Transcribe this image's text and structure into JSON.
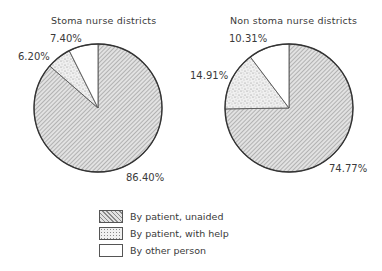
{
  "chart_data": [
    {
      "type": "pie",
      "title": "Stoma nurse districts",
      "categories": [
        "By patient, unaided",
        "By patient, with help",
        "By other person"
      ],
      "values": [
        86.4,
        6.2,
        7.4
      ],
      "labels": [
        "86.40%",
        "6.20%",
        "7.40%"
      ]
    },
    {
      "type": "pie",
      "title": "Non stoma nurse districts",
      "categories": [
        "By patient, unaided",
        "By patient, with help",
        "By other person"
      ],
      "values": [
        74.77,
        14.91,
        10.31
      ],
      "labels": [
        "74.77%",
        "14.91%",
        "10.31%"
      ]
    }
  ],
  "legend": {
    "position": "bottom-center",
    "items": [
      {
        "label": "By patient, unaided",
        "pattern": "diagonal-hatch"
      },
      {
        "label": "By patient, with help",
        "pattern": "stipple"
      },
      {
        "label": "By other person",
        "pattern": "white"
      }
    ]
  }
}
